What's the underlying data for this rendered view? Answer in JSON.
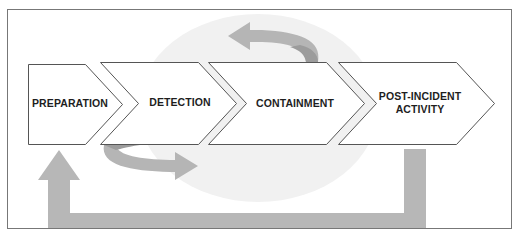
{
  "diagram": {
    "type": "process-flow",
    "phases": [
      {
        "label": "PREPARATION"
      },
      {
        "label": "DETECTION"
      },
      {
        "label": "CONTAINMENT"
      },
      {
        "label": "POST-INCIDENT ACTIVITY",
        "line1": "POST-INCIDENT",
        "line2": "ACTIVITY"
      }
    ],
    "arrows": [
      {
        "name": "loop-back-arrow-detection",
        "description": "curved arrow under Detection pointing right"
      },
      {
        "name": "loop-back-arrow-containment",
        "description": "curved arrow above Containment pointing left"
      },
      {
        "name": "feedback-arrow",
        "description": "L-shaped arrow from Post-Incident Activity back to Preparation"
      }
    ],
    "colors": {
      "arrow": "#b7b7b7",
      "arrow_dark": "#9e9e9e",
      "background_circle": "#efefef",
      "outline": "#555555",
      "frame": "#777777"
    }
  }
}
